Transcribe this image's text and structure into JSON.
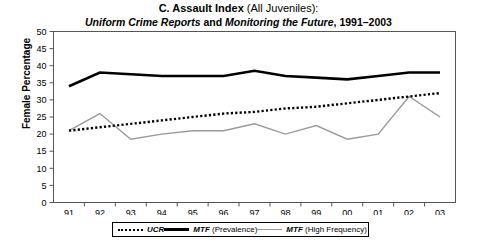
{
  "figure": {
    "panel_letter": "C.",
    "title_bold": "C. Assault Index",
    "title_normal": " (All Juveniles):",
    "title_full": "C. Assault Index (All Juveniles):",
    "subtitle_source1": "Uniform Crime Reports",
    "subtitle_conj": " and ",
    "subtitle_source2": "Monitoring the Future",
    "subtitle_years": ", 1991–2003",
    "subtitle_full": "Uniform Crime Reports and Monitoring the Future, 1991–2003"
  },
  "axes": {
    "ylabel": "Female Percentage",
    "ytick_labels": [
      "50",
      "45",
      "40",
      "35",
      "30",
      "25",
      "20",
      "15",
      "10",
      "5",
      "0"
    ],
    "xtick_labels": [
      "91",
      "92",
      "93",
      "94",
      "95",
      "96",
      "97",
      "98",
      "99",
      "00",
      "01",
      "02",
      "03"
    ]
  },
  "legend": {
    "position": "bottom-center",
    "items": [
      {
        "key": "dotted-line-key",
        "style": "dotted",
        "color": "#000000",
        "label_italic": "UCR",
        "label_rest": ""
      },
      {
        "key": "thick-black-line-key",
        "style": "solid-thick",
        "color": "#000000",
        "label_italic": "MTF",
        "label_rest": " (Prevalence)"
      },
      {
        "key": "gray-line-key",
        "style": "solid-thin",
        "color": "#9a9a9a",
        "label_italic": "MTF",
        "label_rest": " (High Frequency)"
      }
    ]
  },
  "chart_data": {
    "type": "line",
    "title": "C. Assault Index (All Juveniles): Uniform Crime Reports and Monitoring the Future, 1991–2003",
    "xlabel": "",
    "ylabel": "Female Percentage",
    "categories": [
      "91",
      "92",
      "93",
      "94",
      "95",
      "96",
      "97",
      "98",
      "99",
      "00",
      "01",
      "02",
      "03"
    ],
    "ylim": [
      0,
      50
    ],
    "ytick_step": 5,
    "grid": false,
    "legend_position": "bottom-center",
    "series": [
      {
        "name": "UCR",
        "style": "dotted",
        "color": "#000000",
        "values": [
          21,
          22,
          23,
          24,
          25,
          26,
          26.5,
          27.5,
          28,
          29,
          30,
          31,
          32
        ]
      },
      {
        "name": "MTF (Prevalence)",
        "style": "solid-thick",
        "color": "#000000",
        "values": [
          34,
          38,
          37.5,
          37,
          37,
          37,
          38.5,
          37,
          36.5,
          36,
          37,
          38,
          38
        ]
      },
      {
        "name": "MTF (High Frequency)",
        "style": "solid-thin",
        "color": "#9a9a9a",
        "values": [
          21,
          26,
          18.5,
          20,
          21,
          21,
          23,
          20,
          22.5,
          18.5,
          20,
          31,
          25
        ]
      }
    ]
  }
}
